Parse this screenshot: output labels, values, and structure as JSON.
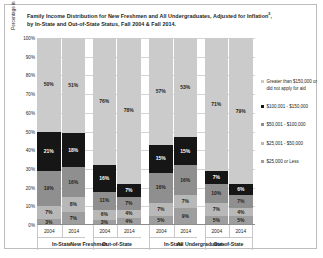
{
  "title": {
    "line1": "Family Income Distribution for New Freshmen and All Undergraduates, Adjusted for Inflation",
    "footnote_marker": "2",
    "line2": "by In-State and Out-of-State Status, Fall 2004 & Fall 2014."
  },
  "chart_data": {
    "type": "bar",
    "xlabel": "",
    "ylabel": "Percentage in Family Income Band",
    "ylim": [
      0,
      100
    ],
    "yticks": [
      "0%",
      "10%",
      "20%",
      "30%",
      "40%",
      "50%",
      "60%",
      "70%",
      "80%",
      "90%",
      "100%"
    ],
    "grid": true,
    "stacked": true,
    "legend_position": "right",
    "categories": [
      "2004",
      "2014",
      "2004",
      "2014",
      "2004",
      "2014",
      "2004",
      "2014"
    ],
    "group_labels": [
      "In-State",
      "Out-of-State",
      "In-State",
      "Out-of-State"
    ],
    "super_group_labels": [
      "New Freshmen",
      "All Undergraduates"
    ],
    "series": [
      {
        "name": "$25,000 or Less",
        "color": "#9e9e9e",
        "values": [
          3,
          7,
          3,
          4,
          5,
          9,
          5,
          5
        ]
      },
      {
        "name": "$25,001 - $50,000",
        "color": "#b8b8b8",
        "values": [
          7,
          8,
          6,
          4,
          7,
          7,
          7,
          4
        ]
      },
      {
        "name": "$50,001 - $100,000",
        "color": "#8f8f8f",
        "values": [
          19,
          16,
          11,
          7,
          16,
          16,
          10,
          7
        ]
      },
      {
        "name": "$100,001 - $150,000",
        "color": "#161616",
        "values": [
          21,
          18,
          16,
          7,
          15,
          15,
          7,
          6
        ]
      },
      {
        "name": "Greater than $150,000 or did not apply for aid",
        "color": "#cbcbcb",
        "values": [
          50,
          51,
          76,
          78,
          57,
          53,
          71,
          79
        ]
      }
    ],
    "bar_labels": [
      [
        "3%",
        "7%",
        "19%",
        "21%",
        "50%"
      ],
      [
        "7%",
        "8%",
        "16%",
        "18%",
        "51%"
      ],
      [
        "3%",
        "6%",
        "11%",
        "16%",
        "76%"
      ],
      [
        "4%",
        "4%",
        "7%",
        "7%",
        "78%"
      ],
      [
        "5%",
        "7%",
        "16%",
        "15%",
        "57%"
      ],
      [
        "9%",
        "7%",
        "16%",
        "15%",
        "53%"
      ],
      [
        "5%",
        "7%",
        "10%",
        "7%",
        "71%"
      ],
      [
        "5%",
        "4%",
        "7%",
        "6%",
        "79%"
      ]
    ]
  },
  "legend": [
    {
      "label": "Greater than $150,000 or did not apply for aid",
      "color": "#cbcbcb"
    },
    {
      "label": "$100,001 - $150,000",
      "color": "#161616"
    },
    {
      "label": "$50,001 - $100,000",
      "color": "#8f8f8f"
    },
    {
      "label": "$25,001 - $50,000",
      "color": "#b8b8b8"
    },
    {
      "label": "$25,000 or Less",
      "color": "#9e9e9e"
    }
  ]
}
